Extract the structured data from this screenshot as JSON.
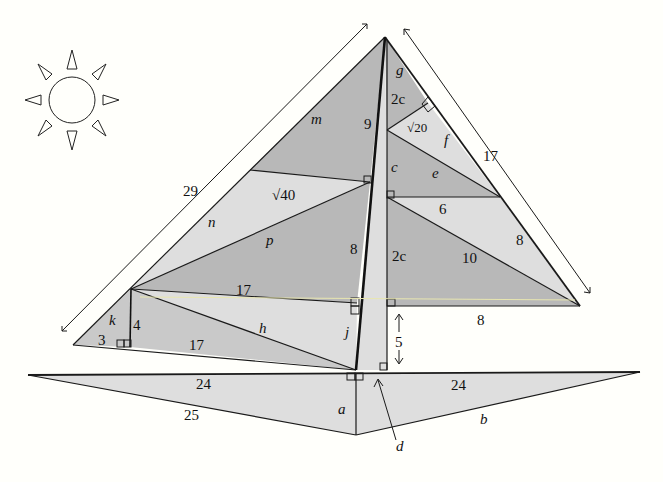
{
  "figure": {
    "type": "geometry-diagram"
  },
  "sun": {
    "icon": "sun-icon",
    "rays": 8
  },
  "dimension_labels": {
    "left_sail_length": "29",
    "right_sail_length": "17",
    "gap_height": "5"
  },
  "left_sail": {
    "m": "m",
    "sqrt40": "√40",
    "n": "n",
    "p": "p",
    "nine": "9",
    "eight": "8",
    "seventeen_top": "17",
    "k": "k",
    "four": "4",
    "three": "3",
    "seventeen_bottom": "17",
    "h": "h",
    "j": "j"
  },
  "right_sail": {
    "g": "g",
    "two_c_top": "2c",
    "sqrt20": "√20",
    "f": "f",
    "c": "c",
    "e": "e",
    "six": "6",
    "eight_side": "8",
    "two_c_bottom": "2c",
    "ten": "10",
    "eight_bottom": "8"
  },
  "hull": {
    "left_top": "24",
    "left_bottom": "25",
    "right_top": "24",
    "right_bottom": "b",
    "a": "a",
    "d": "d"
  }
}
